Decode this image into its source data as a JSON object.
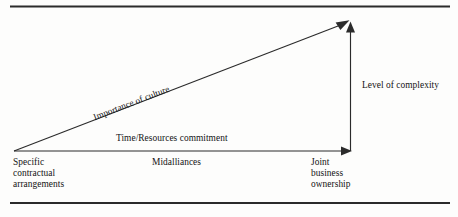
{
  "figure": {
    "type": "diagram",
    "kind": "alliance-continuum-triangle",
    "background_color": "#fdfdfc",
    "ink_color": "#2b2b2b",
    "rules": {
      "top_rule": "",
      "bottom_rule": ""
    },
    "arrows": {
      "hypotenuse": {
        "label": "Importance of culture",
        "from": "origin",
        "to": "apex"
      },
      "horizontal": {
        "label": "Time/Resources commitment",
        "from": "origin",
        "to": "right-base"
      },
      "vertical": {
        "label": "Level of complexity",
        "from": "right-base",
        "to": "apex"
      }
    },
    "stages": {
      "left": "Specific\ncontractual\narrangements",
      "middle": "Midalliances",
      "right": "Joint\nbusiness\nownership"
    }
  }
}
